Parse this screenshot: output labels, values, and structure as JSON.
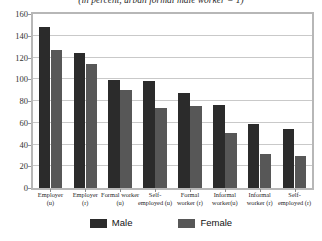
{
  "chart_data": {
    "type": "bar",
    "title": "(in percent, urban formal male worker = 1)",
    "subtitle": "",
    "xlabel": "",
    "ylabel": "",
    "ylim": [
      0,
      160
    ],
    "ytick_step": 20,
    "yticks": [
      "160",
      "140",
      "120",
      "100",
      "80",
      "60",
      "40",
      "20",
      "0"
    ],
    "grid": true,
    "legend_position": "bottom",
    "categories": [
      "Employer (u)",
      "Employer (r)",
      "Formal worker (u)",
      "Self-employed (u)",
      "Formal worker (r)",
      "Informal worker(u)",
      "Informal worker (r)",
      "Self-employed (r)"
    ],
    "categories_lines": [
      [
        "Employer",
        "(u)"
      ],
      [
        "Employer",
        "(r)"
      ],
      [
        "Formal worker",
        "(u)"
      ],
      [
        "Self-",
        "employed (u)"
      ],
      [
        "Formal",
        "worker (r)"
      ],
      [
        "Informal",
        "worker(u)"
      ],
      [
        "Informal",
        "worker (r)"
      ],
      [
        "Self-",
        "employed (r)"
      ]
    ],
    "series": [
      {
        "name": "Male",
        "color": "#2b2b2b",
        "values": [
          148,
          124,
          99,
          98,
          87,
          76,
          59,
          54
        ]
      },
      {
        "name": "Female",
        "color": "#575757",
        "values": [
          127,
          114,
          90,
          74,
          75,
          51,
          31,
          29
        ]
      }
    ],
    "legend": [
      {
        "label": "Male",
        "color": "#2b2b2b"
      },
      {
        "label": "Female",
        "color": "#575757"
      }
    ]
  }
}
